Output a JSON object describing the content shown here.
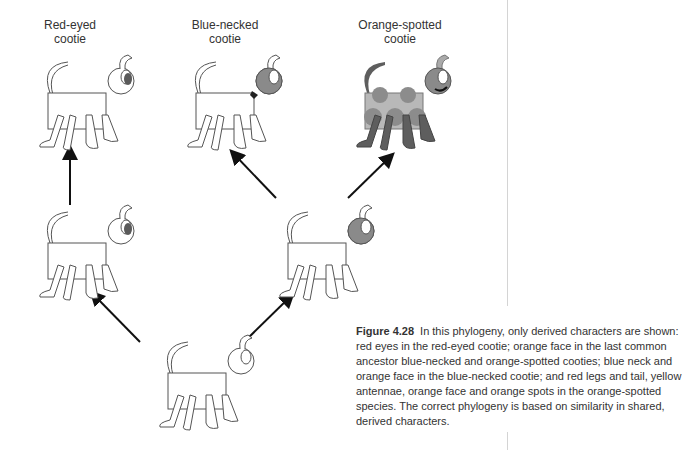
{
  "figure": {
    "labels": [
      {
        "id": "red-eyed",
        "line1": "Red-eyed",
        "line2": "cootie"
      },
      {
        "id": "blue-necked",
        "line1": "Blue-necked",
        "line2": "cootie"
      },
      {
        "id": "orange-spotted",
        "line1": "Orange-spotted",
        "line2": "cootie"
      }
    ],
    "caption": {
      "figure_number": "Figure 4.28",
      "text": "In this phylogeny, only derived characters are shown: red eyes in the red-eyed cootie; orange face in the last common ancestor blue-necked and orange-spotted cooties; blue neck and orange face in the blue-necked cootie; and red legs and tail, yellow antennae, orange face and orange spots in the orange-spotted species. The correct phylogeny is based on similarity in shared, derived characters."
    },
    "nodes": [
      {
        "id": "ancestor",
        "x": 160,
        "y": 335
      },
      {
        "id": "red-eyed-ancestor",
        "x": 30,
        "y": 205
      },
      {
        "id": "orange-face-ancestor",
        "x": 270,
        "y": 205
      },
      {
        "id": "red-eyed",
        "x": 30,
        "y": 55
      },
      {
        "id": "blue-necked",
        "x": 178,
        "y": 55
      },
      {
        "id": "orange-spotted",
        "x": 345,
        "y": 55
      }
    ],
    "colors": {
      "outline": "#555555",
      "face": "#8a8a8a",
      "eye": "#5a5a5a",
      "body_spotted": "#b8b8b8",
      "spot": "#8c8c8c",
      "legs": "#5e5e5e",
      "arrow": "#111111"
    }
  }
}
